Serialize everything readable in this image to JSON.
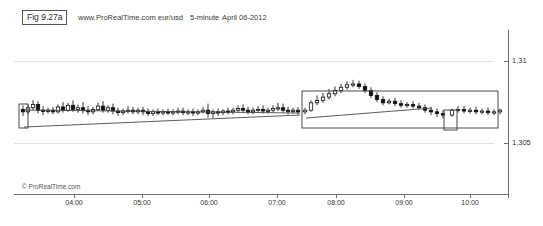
{
  "header": {
    "fig_label": "Fig 9.27a",
    "site": "www.ProRealTime.com",
    "symbol": "eur/usd",
    "timeframe": "5-minute",
    "date": "April 06-2012"
  },
  "watermark": "© ProRealTime.com",
  "chart_data": {
    "type": "line",
    "subtype": "candlestick",
    "title": "eur/usd 5-minute April 06-2012",
    "xlabel": "",
    "ylabel": "",
    "grid": true,
    "legend": false,
    "xtick_labels": [
      "04:00",
      "05:00",
      "06:00",
      "07:00",
      "08:00",
      "09:00",
      "10:00"
    ],
    "xtick_px": [
      74,
      142,
      209,
      277,
      336,
      404,
      470
    ],
    "ytick_labels": [
      "1,31",
      "1,305"
    ],
    "ytick_values": [
      1.31,
      1.305
    ],
    "ytick_px": [
      61,
      143
    ],
    "ylim": [
      1.3035,
      1.3115
    ],
    "price_per_px": 6.1e-05,
    "candles": [
      {
        "t": "03:30",
        "x": 23,
        "o": 1.30705,
        "h": 1.3073,
        "c": 1.3069,
        "l": 1.30665,
        "dir": "down"
      },
      {
        "t": "03:35",
        "x": 28,
        "o": 1.3069,
        "h": 1.30735,
        "c": 1.30715,
        "l": 1.30675,
        "dir": "up"
      },
      {
        "t": "03:40",
        "x": 33,
        "o": 1.30715,
        "h": 1.3076,
        "c": 1.30735,
        "l": 1.307,
        "dir": "up"
      },
      {
        "t": "03:45",
        "x": 38,
        "o": 1.30735,
        "h": 1.30755,
        "c": 1.307,
        "l": 1.3068,
        "dir": "down"
      },
      {
        "t": "03:50",
        "x": 43,
        "o": 1.307,
        "h": 1.30725,
        "c": 1.30695,
        "l": 1.3067,
        "dir": "down"
      },
      {
        "t": "03:55",
        "x": 48,
        "o": 1.30695,
        "h": 1.30715,
        "c": 1.307,
        "l": 1.3068,
        "dir": "up"
      },
      {
        "t": "04:00",
        "x": 53,
        "o": 1.307,
        "h": 1.3072,
        "c": 1.3069,
        "l": 1.30675,
        "dir": "down"
      },
      {
        "t": "04:05",
        "x": 58,
        "o": 1.3069,
        "h": 1.30735,
        "c": 1.3072,
        "l": 1.3068,
        "dir": "up"
      },
      {
        "t": "04:10",
        "x": 63,
        "o": 1.3072,
        "h": 1.3075,
        "c": 1.307,
        "l": 1.30685,
        "dir": "down"
      },
      {
        "t": "04:15",
        "x": 68,
        "o": 1.307,
        "h": 1.30745,
        "c": 1.3073,
        "l": 1.3069,
        "dir": "up"
      },
      {
        "t": "04:20",
        "x": 73,
        "o": 1.3073,
        "h": 1.3076,
        "c": 1.30705,
        "l": 1.3069,
        "dir": "down"
      },
      {
        "t": "04:25",
        "x": 78,
        "o": 1.30705,
        "h": 1.30735,
        "c": 1.30715,
        "l": 1.30685,
        "dir": "up"
      },
      {
        "t": "04:30",
        "x": 83,
        "o": 1.30715,
        "h": 1.3075,
        "c": 1.307,
        "l": 1.3068,
        "dir": "down"
      },
      {
        "t": "04:35",
        "x": 88,
        "o": 1.307,
        "h": 1.30725,
        "c": 1.3069,
        "l": 1.3067,
        "dir": "down"
      },
      {
        "t": "04:40",
        "x": 93,
        "o": 1.3069,
        "h": 1.3072,
        "c": 1.30705,
        "l": 1.30675,
        "dir": "up"
      },
      {
        "t": "04:45",
        "x": 98,
        "o": 1.30705,
        "h": 1.30745,
        "c": 1.30725,
        "l": 1.30695,
        "dir": "up"
      },
      {
        "t": "04:50",
        "x": 103,
        "o": 1.30725,
        "h": 1.30755,
        "c": 1.307,
        "l": 1.30685,
        "dir": "down"
      },
      {
        "t": "04:55",
        "x": 108,
        "o": 1.307,
        "h": 1.3073,
        "c": 1.30715,
        "l": 1.30685,
        "dir": "up"
      },
      {
        "t": "05:00",
        "x": 113,
        "o": 1.30715,
        "h": 1.3074,
        "c": 1.30695,
        "l": 1.30675,
        "dir": "down"
      },
      {
        "t": "05:05",
        "x": 118,
        "o": 1.30695,
        "h": 1.30715,
        "c": 1.30685,
        "l": 1.30665,
        "dir": "down"
      },
      {
        "t": "05:10",
        "x": 123,
        "o": 1.30685,
        "h": 1.3071,
        "c": 1.30695,
        "l": 1.3067,
        "dir": "up"
      },
      {
        "t": "05:15",
        "x": 128,
        "o": 1.30695,
        "h": 1.30725,
        "c": 1.307,
        "l": 1.3068,
        "dir": "up"
      },
      {
        "t": "05:20",
        "x": 133,
        "o": 1.307,
        "h": 1.3072,
        "c": 1.3069,
        "l": 1.30675,
        "dir": "down"
      },
      {
        "t": "05:25",
        "x": 138,
        "o": 1.3069,
        "h": 1.30715,
        "c": 1.307,
        "l": 1.30675,
        "dir": "up"
      },
      {
        "t": "05:30",
        "x": 143,
        "o": 1.307,
        "h": 1.3072,
        "c": 1.3069,
        "l": 1.3067,
        "dir": "down"
      },
      {
        "t": "05:35",
        "x": 148,
        "o": 1.3069,
        "h": 1.3071,
        "c": 1.3068,
        "l": 1.30665,
        "dir": "down"
      },
      {
        "t": "05:40",
        "x": 153,
        "o": 1.3068,
        "h": 1.30705,
        "c": 1.3069,
        "l": 1.30665,
        "dir": "up"
      },
      {
        "t": "05:45",
        "x": 158,
        "o": 1.3069,
        "h": 1.3071,
        "c": 1.30685,
        "l": 1.3067,
        "dir": "down"
      },
      {
        "t": "05:50",
        "x": 163,
        "o": 1.30685,
        "h": 1.30705,
        "c": 1.3069,
        "l": 1.3067,
        "dir": "up"
      },
      {
        "t": "05:55",
        "x": 168,
        "o": 1.3069,
        "h": 1.3071,
        "c": 1.30685,
        "l": 1.3067,
        "dir": "down"
      },
      {
        "t": "06:00",
        "x": 173,
        "o": 1.30685,
        "h": 1.30705,
        "c": 1.3069,
        "l": 1.3067,
        "dir": "up"
      },
      {
        "t": "06:05",
        "x": 178,
        "o": 1.3069,
        "h": 1.30715,
        "c": 1.30695,
        "l": 1.30675,
        "dir": "up"
      },
      {
        "t": "06:10",
        "x": 183,
        "o": 1.30695,
        "h": 1.30715,
        "c": 1.30685,
        "l": 1.3067,
        "dir": "down"
      },
      {
        "t": "06:15",
        "x": 188,
        "o": 1.30685,
        "h": 1.30705,
        "c": 1.3069,
        "l": 1.3067,
        "dir": "up"
      },
      {
        "t": "06:20",
        "x": 193,
        "o": 1.3069,
        "h": 1.3071,
        "c": 1.30685,
        "l": 1.30665,
        "dir": "down"
      },
      {
        "t": "06:25",
        "x": 198,
        "o": 1.30685,
        "h": 1.30705,
        "c": 1.3069,
        "l": 1.3067,
        "dir": "up"
      },
      {
        "t": "06:30",
        "x": 203,
        "o": 1.3069,
        "h": 1.3072,
        "c": 1.307,
        "l": 1.3068,
        "dir": "up"
      },
      {
        "t": "06:35",
        "x": 208,
        "o": 1.307,
        "h": 1.3074,
        "c": 1.3068,
        "l": 1.30655,
        "dir": "down"
      },
      {
        "t": "06:40",
        "x": 213,
        "o": 1.3068,
        "h": 1.30705,
        "c": 1.3069,
        "l": 1.3065,
        "dir": "up"
      },
      {
        "t": "06:45",
        "x": 218,
        "o": 1.3069,
        "h": 1.3071,
        "c": 1.30685,
        "l": 1.30665,
        "dir": "down"
      },
      {
        "t": "06:50",
        "x": 223,
        "o": 1.30685,
        "h": 1.30705,
        "c": 1.30695,
        "l": 1.3067,
        "dir": "up"
      },
      {
        "t": "06:55",
        "x": 228,
        "o": 1.30695,
        "h": 1.30715,
        "c": 1.3069,
        "l": 1.30675,
        "dir": "down"
      },
      {
        "t": "07:00",
        "x": 233,
        "o": 1.3069,
        "h": 1.30715,
        "c": 1.307,
        "l": 1.30675,
        "dir": "up"
      },
      {
        "t": "07:05",
        "x": 238,
        "o": 1.307,
        "h": 1.3073,
        "c": 1.3071,
        "l": 1.30685,
        "dir": "up"
      },
      {
        "t": "07:10",
        "x": 243,
        "o": 1.3071,
        "h": 1.30735,
        "c": 1.307,
        "l": 1.30685,
        "dir": "down"
      },
      {
        "t": "07:15",
        "x": 248,
        "o": 1.307,
        "h": 1.3072,
        "c": 1.3069,
        "l": 1.30675,
        "dir": "down"
      },
      {
        "t": "07:20",
        "x": 253,
        "o": 1.3069,
        "h": 1.30715,
        "c": 1.307,
        "l": 1.30675,
        "dir": "up"
      },
      {
        "t": "07:25",
        "x": 258,
        "o": 1.307,
        "h": 1.30725,
        "c": 1.30705,
        "l": 1.30685,
        "dir": "up"
      },
      {
        "t": "07:30",
        "x": 263,
        "o": 1.30705,
        "h": 1.3073,
        "c": 1.30695,
        "l": 1.3068,
        "dir": "down"
      },
      {
        "t": "07:35",
        "x": 268,
        "o": 1.30695,
        "h": 1.30715,
        "c": 1.307,
        "l": 1.3068,
        "dir": "up"
      },
      {
        "t": "07:40",
        "x": 273,
        "o": 1.307,
        "h": 1.3073,
        "c": 1.3071,
        "l": 1.30685,
        "dir": "up"
      },
      {
        "t": "07:45",
        "x": 278,
        "o": 1.3071,
        "h": 1.30745,
        "c": 1.30715,
        "l": 1.30695,
        "dir": "up"
      },
      {
        "t": "07:50",
        "x": 283,
        "o": 1.30715,
        "h": 1.3074,
        "c": 1.307,
        "l": 1.30685,
        "dir": "down"
      },
      {
        "t": "07:55",
        "x": 288,
        "o": 1.307,
        "h": 1.3072,
        "c": 1.30695,
        "l": 1.30675,
        "dir": "down"
      },
      {
        "t": "08:00",
        "x": 293,
        "o": 1.30695,
        "h": 1.30715,
        "c": 1.307,
        "l": 1.3068,
        "dir": "up"
      },
      {
        "t": "08:05",
        "x": 298,
        "o": 1.307,
        "h": 1.3072,
        "c": 1.3069,
        "l": 1.30675,
        "dir": "down"
      },
      {
        "t": "08:10",
        "x": 305,
        "o": 1.3069,
        "h": 1.30715,
        "c": 1.307,
        "l": 1.30675,
        "dir": "up"
      },
      {
        "t": "08:15",
        "x": 311,
        "o": 1.307,
        "h": 1.3076,
        "c": 1.30745,
        "l": 1.3069,
        "dir": "up"
      },
      {
        "t": "08:20",
        "x": 317,
        "o": 1.30745,
        "h": 1.3079,
        "c": 1.3076,
        "l": 1.3073,
        "dir": "up"
      },
      {
        "t": "08:25",
        "x": 323,
        "o": 1.3076,
        "h": 1.30805,
        "c": 1.3078,
        "l": 1.30745,
        "dir": "up"
      },
      {
        "t": "08:30",
        "x": 329,
        "o": 1.3078,
        "h": 1.3083,
        "c": 1.308,
        "l": 1.30765,
        "dir": "up"
      },
      {
        "t": "08:35",
        "x": 335,
        "o": 1.308,
        "h": 1.30845,
        "c": 1.3082,
        "l": 1.30785,
        "dir": "up"
      },
      {
        "t": "08:40",
        "x": 341,
        "o": 1.3082,
        "h": 1.3086,
        "c": 1.3084,
        "l": 1.30805,
        "dir": "up"
      },
      {
        "t": "08:45",
        "x": 347,
        "o": 1.3084,
        "h": 1.30875,
        "c": 1.30855,
        "l": 1.30825,
        "dir": "up"
      },
      {
        "t": "08:50",
        "x": 353,
        "o": 1.30855,
        "h": 1.30885,
        "c": 1.3086,
        "l": 1.3084,
        "dir": "up"
      },
      {
        "t": "08:55",
        "x": 359,
        "o": 1.3086,
        "h": 1.3088,
        "c": 1.30845,
        "l": 1.3083,
        "dir": "down"
      },
      {
        "t": "09:00",
        "x": 365,
        "o": 1.30845,
        "h": 1.30865,
        "c": 1.3082,
        "l": 1.30805,
        "dir": "down"
      },
      {
        "t": "09:05",
        "x": 371,
        "o": 1.3082,
        "h": 1.3084,
        "c": 1.3079,
        "l": 1.30775,
        "dir": "down"
      },
      {
        "t": "09:10",
        "x": 377,
        "o": 1.3079,
        "h": 1.3081,
        "c": 1.30765,
        "l": 1.3075,
        "dir": "down"
      },
      {
        "t": "09:15",
        "x": 383,
        "o": 1.30765,
        "h": 1.30785,
        "c": 1.30745,
        "l": 1.3073,
        "dir": "down"
      },
      {
        "t": "09:20",
        "x": 389,
        "o": 1.30745,
        "h": 1.3077,
        "c": 1.30755,
        "l": 1.30735,
        "dir": "up"
      },
      {
        "t": "09:25",
        "x": 395,
        "o": 1.30755,
        "h": 1.30775,
        "c": 1.3074,
        "l": 1.30725,
        "dir": "down"
      },
      {
        "t": "09:30",
        "x": 401,
        "o": 1.3074,
        "h": 1.3076,
        "c": 1.3073,
        "l": 1.30715,
        "dir": "down"
      },
      {
        "t": "09:35",
        "x": 407,
        "o": 1.3073,
        "h": 1.3075,
        "c": 1.30735,
        "l": 1.30715,
        "dir": "up"
      },
      {
        "t": "09:40",
        "x": 413,
        "o": 1.30735,
        "h": 1.30755,
        "c": 1.30725,
        "l": 1.3071,
        "dir": "down"
      },
      {
        "t": "09:45",
        "x": 419,
        "o": 1.30725,
        "h": 1.30745,
        "c": 1.30715,
        "l": 1.307,
        "dir": "down"
      },
      {
        "t": "09:50",
        "x": 425,
        "o": 1.30715,
        "h": 1.30735,
        "c": 1.307,
        "l": 1.30685,
        "dir": "down"
      },
      {
        "t": "09:55",
        "x": 431,
        "o": 1.307,
        "h": 1.3072,
        "c": 1.3069,
        "l": 1.3067,
        "dir": "down"
      },
      {
        "t": "10:00",
        "x": 437,
        "o": 1.3069,
        "h": 1.3071,
        "c": 1.3068,
        "l": 1.3066,
        "dir": "down"
      },
      {
        "t": "10:05",
        "x": 443,
        "o": 1.3068,
        "h": 1.307,
        "c": 1.3067,
        "l": 1.3065,
        "dir": "down"
      },
      {
        "t": "10:10",
        "x": 452,
        "o": 1.3067,
        "h": 1.3071,
        "c": 1.307,
        "l": 1.3066,
        "dir": "up"
      },
      {
        "t": "10:15",
        "x": 458,
        "o": 1.307,
        "h": 1.30725,
        "c": 1.30705,
        "l": 1.30685,
        "dir": "up"
      },
      {
        "t": "10:20",
        "x": 464,
        "o": 1.30705,
        "h": 1.30725,
        "c": 1.30695,
        "l": 1.3068,
        "dir": "down"
      },
      {
        "t": "10:25",
        "x": 470,
        "o": 1.30695,
        "h": 1.30715,
        "c": 1.307,
        "l": 1.3068,
        "dir": "up"
      },
      {
        "t": "10:30",
        "x": 476,
        "o": 1.307,
        "h": 1.3072,
        "c": 1.3069,
        "l": 1.30675,
        "dir": "down"
      },
      {
        "t": "10:35",
        "x": 482,
        "o": 1.3069,
        "h": 1.3071,
        "c": 1.30695,
        "l": 1.30675,
        "dir": "up"
      },
      {
        "t": "10:40",
        "x": 488,
        "o": 1.30695,
        "h": 1.30715,
        "c": 1.30685,
        "l": 1.3067,
        "dir": "down"
      },
      {
        "t": "10:45",
        "x": 494,
        "o": 1.30685,
        "h": 1.30705,
        "c": 1.3069,
        "l": 1.3067,
        "dir": "up"
      },
      {
        "t": "10:50",
        "x": 500,
        "o": 1.3069,
        "h": 1.3071,
        "c": 1.307,
        "l": 1.30675,
        "dir": "up"
      }
    ],
    "annotations": [
      {
        "name": "left-consolidation-box",
        "shape": "rect",
        "x": 19,
        "y": 104,
        "w": 9,
        "h": 24
      },
      {
        "name": "breakout-channel-box",
        "shape": "rect",
        "x": 302,
        "y": 91,
        "w": 196,
        "h": 37
      },
      {
        "name": "pullback-box",
        "shape": "rect",
        "x": 444,
        "y": 110,
        "w": 13,
        "h": 20
      },
      {
        "name": "rising-trendline-lower",
        "shape": "line",
        "x1": 24,
        "y1": 127,
        "x2": 300,
        "y2": 115
      },
      {
        "name": "rising-trendline-upper",
        "shape": "line",
        "x1": 24,
        "y1": 110,
        "x2": 300,
        "y2": 113
      },
      {
        "name": "channel-inner-trendline",
        "shape": "line",
        "x1": 306,
        "y1": 118,
        "x2": 432,
        "y2": 108
      }
    ]
  }
}
